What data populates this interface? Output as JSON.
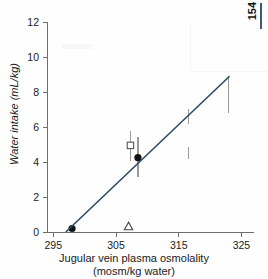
{
  "page_marker": {
    "number": "154",
    "rule_color": "#3a5a7a"
  },
  "chart_data": {
    "type": "scatter",
    "title": "",
    "xlabel": "Jugular vein plasma osmolality",
    "xlabel_line2": "(mosm/kg water)",
    "ylabel": "Water intake (mL/kg)",
    "xlim": [
      294,
      327
    ],
    "ylim": [
      0,
      12
    ],
    "xticks": [
      295,
      305,
      315,
      325
    ],
    "xtick_labels": [
      "295",
      "305",
      "315",
      "325"
    ],
    "yticks": [
      0,
      2,
      4,
      6,
      8,
      10,
      12
    ],
    "ytick_labels": [
      "0",
      "2",
      "4",
      "6",
      "8",
      "10",
      "12"
    ],
    "grid": false,
    "legend": "none",
    "line_color": "#2d4a68",
    "errorbar_color": "#9a9a9a",
    "marker_fill_color": "#111111",
    "series": [
      {
        "name": "filled-circle",
        "marker": "filled-circle",
        "points": [
          {
            "x": 298.0,
            "y": 0.2,
            "yerr_low": 0.0,
            "yerr_high": 0.0
          },
          {
            "x": 308.5,
            "y": 4.25,
            "yerr_low": 3.15,
            "yerr_high": 5.45
          }
        ]
      },
      {
        "name": "open-square",
        "marker": "open-square",
        "points": [
          {
            "x": 307.3,
            "y": 4.95,
            "yerr_low": 4.05,
            "yerr_high": 5.8
          }
        ]
      },
      {
        "name": "open-triangle",
        "marker": "open-triangle",
        "points": [
          {
            "x": 307.0,
            "y": 0.32,
            "yerr_low": 0.32,
            "yerr_high": 0.32
          }
        ]
      },
      {
        "name": "error-bar-only",
        "marker": "none",
        "points": [
          {
            "x": 316.6,
            "y": 6.6,
            "yerr_low": 6.15,
            "yerr_high": 7.05
          },
          {
            "x": 316.6,
            "y": 4.5,
            "yerr_low": 4.15,
            "yerr_high": 4.85
          },
          {
            "x": 322.9,
            "y": 7.85,
            "yerr_low": 6.8,
            "yerr_high": 8.9
          }
        ]
      }
    ],
    "fit_line": {
      "name": "regression-line",
      "x0": 297.0,
      "y0": 0.0,
      "x1": 323.1,
      "y1": 8.9
    }
  }
}
